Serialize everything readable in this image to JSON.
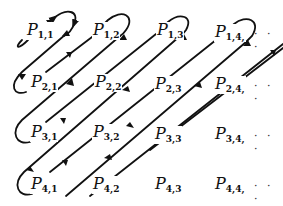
{
  "diagram": {
    "symbol": "P",
    "rows": [
      [
        {
          "sub": "1,1"
        },
        {
          "sub": "1,2"
        },
        {
          "sub": "1,3"
        },
        {
          "sub": "1,4,"
        }
      ],
      [
        {
          "sub": "2,1"
        },
        {
          "sub": "2,2"
        },
        {
          "sub": "2,3"
        },
        {
          "sub": "2,4,"
        }
      ],
      [
        {
          "sub": "3,1"
        },
        {
          "sub": "3,2"
        },
        {
          "sub": "3,3"
        },
        {
          "sub": "3,4,"
        }
      ],
      [
        {
          "sub": "4,1"
        },
        {
          "sub": "4,2"
        },
        {
          "sub": "4,3"
        },
        {
          "sub": "4,4,"
        }
      ]
    ],
    "continuation": "· · ·",
    "stroke_color": "#111111"
  },
  "labels": {
    "P11": "P",
    "P11_sub": "1,1",
    "P12": "P",
    "P12_sub": "1,2",
    "P13": "P",
    "P13_sub": "1,3",
    "P14": "P",
    "P14_sub": "1,4,",
    "P21": "P",
    "P21_sub": "2,1",
    "P22": "P",
    "P22_sub": "2,2",
    "P23": "P",
    "P23_sub": "2,3",
    "P24": "P",
    "P24_sub": "2,4,",
    "P31": "P",
    "P31_sub": "3,1",
    "P32": "P",
    "P32_sub": "3,2",
    "P33": "P",
    "P33_sub": "3,3",
    "P34": "P",
    "P34_sub": "3,4,",
    "P41": "P",
    "P41_sub": "4,1",
    "P42": "P",
    "P42_sub": "4,2",
    "P43": "P",
    "P43_sub": "4,3",
    "P44": "P",
    "P44_sub": "4,4,",
    "dots1": "· · ·",
    "dots2": "· · ·",
    "dots3": "· · ·",
    "dots4": "· · ·"
  }
}
